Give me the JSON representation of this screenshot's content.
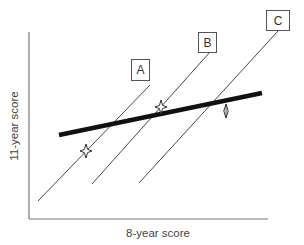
{
  "diagram": {
    "x_axis_label": "8-year score",
    "y_axis_label": "11-year score",
    "lines": [
      {
        "id": "A",
        "label": "A",
        "from": [
          38,
          201
        ],
        "to": [
          150,
          85
        ]
      },
      {
        "id": "B",
        "label": "B",
        "from": [
          92,
          184
        ],
        "to": [
          210,
          52
        ]
      },
      {
        "id": "C",
        "label": "C",
        "from": [
          139,
          183
        ],
        "to": [
          278,
          31
        ]
      }
    ],
    "regression_line": {
      "from": [
        59,
        135
      ],
      "to": [
        262,
        93
      ],
      "description": "thick overall trend line"
    },
    "markers": [
      {
        "type": "star",
        "on_line": "A",
        "position": [
          86,
          151
        ]
      },
      {
        "type": "star",
        "on_line": "B",
        "position": [
          161,
          108
        ]
      },
      {
        "type": "diamond",
        "on_line": "none",
        "position": [
          226,
          111
        ]
      }
    ],
    "colors": {
      "line": "#333333",
      "axis": "#777777",
      "regression": "#111111"
    }
  }
}
